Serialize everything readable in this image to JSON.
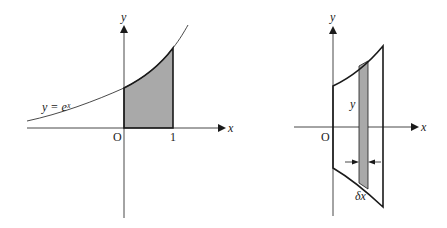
{
  "figure": {
    "left_panel": {
      "description": "Area under y = e^x from x = 0 to x = 1 (shaded)",
      "axis_x_label": "x",
      "axis_y_label": "y",
      "origin_label": "O",
      "tick_label": "1",
      "curve_label": "y = eˣ",
      "colors": {
        "shade": "#a9a9a9",
        "stroke": "#1a1a1a"
      }
    },
    "right_panel": {
      "description": "Solid-of-revolution cross section with thin vertical strip of width δx and height y",
      "axis_x_label": "x",
      "axis_y_label": "y",
      "origin_label": "O",
      "strip_height_label": "y",
      "strip_width_label": "δx",
      "colors": {
        "shade": "#a9a9a9",
        "stroke": "#1a1a1a"
      }
    }
  }
}
